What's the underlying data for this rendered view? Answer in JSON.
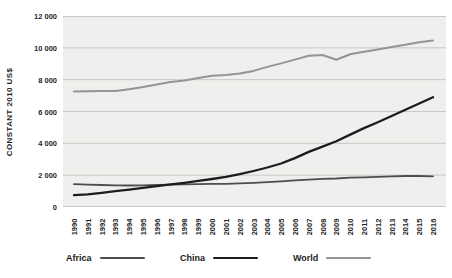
{
  "chart_data": {
    "type": "line",
    "title": "",
    "ylabel": "CONSTANT 2010 US$",
    "xlabel": "",
    "ylim": [
      0,
      12000
    ],
    "ytick_step": 2000,
    "ytick_labels": [
      "0",
      "2 000",
      "4 000",
      "6 000",
      "8 000",
      "10 000",
      "12 000"
    ],
    "grid": "horizontal",
    "legend_position": "bottom",
    "plot_bg_color": "#efefed",
    "grid_color": "#c8c8c6",
    "categories": [
      "1990",
      "1991",
      "1992",
      "1993",
      "1994",
      "1995",
      "1996",
      "1997",
      "1998",
      "1999",
      "2000",
      "2001",
      "2002",
      "2003",
      "2004",
      "2005",
      "2006",
      "2007",
      "2008",
      "2009",
      "2010",
      "2011",
      "2012",
      "2013",
      "2014",
      "2015",
      "2016"
    ],
    "series": [
      {
        "name": "Africa",
        "color": "#4d4d4d",
        "line_width": 1.8,
        "values": [
          1430,
          1410,
          1380,
          1360,
          1350,
          1360,
          1390,
          1410,
          1420,
          1440,
          1450,
          1460,
          1480,
          1520,
          1560,
          1610,
          1670,
          1720,
          1770,
          1790,
          1840,
          1860,
          1890,
          1920,
          1950,
          1950,
          1930
        ]
      },
      {
        "name": "China",
        "color": "#1c1c1c",
        "line_width": 2.3,
        "values": [
          750,
          800,
          890,
          990,
          1090,
          1200,
          1310,
          1420,
          1520,
          1640,
          1760,
          1900,
          2060,
          2260,
          2480,
          2730,
          3070,
          3460,
          3790,
          4130,
          4550,
          4960,
          5330,
          5720,
          6110,
          6500,
          6900
        ]
      },
      {
        "name": "World",
        "color": "#949494",
        "line_width": 2,
        "values": [
          7250,
          7270,
          7280,
          7290,
          7400,
          7530,
          7700,
          7860,
          7950,
          8100,
          8250,
          8300,
          8380,
          8550,
          8800,
          9020,
          9260,
          9500,
          9550,
          9250,
          9600,
          9760,
          9900,
          10050,
          10200,
          10350,
          10470
        ]
      }
    ]
  }
}
